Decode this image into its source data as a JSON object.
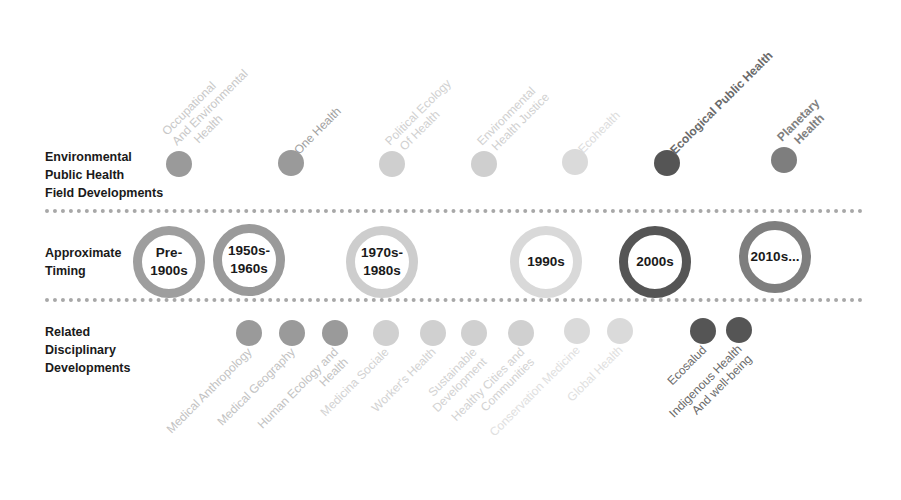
{
  "rows": {
    "field": "Environmental\nPublic Health\nField Developments",
    "timing": "Approximate\nTiming",
    "related": "Related\nDisciplinary\nDevelopments"
  },
  "field_developments": [
    {
      "label": "Occupational\nAnd Environmental\n     Health",
      "x": 179,
      "y": 164,
      "color": "#9a9a9a",
      "text_color": "#c8c8c8",
      "bold": false
    },
    {
      "label": "One Health",
      "x": 291,
      "y": 163,
      "color": "#9a9a9a",
      "text_color": "#a0a0a0",
      "bold": false
    },
    {
      "label": "Political Ecology\n  Of Health",
      "x": 392,
      "y": 164,
      "color": "#cfcfcf",
      "text_color": "#d0d0d0",
      "bold": false
    },
    {
      "label": "Environmental\n  Health Justice",
      "x": 484,
      "y": 164,
      "color": "#cfcfcf",
      "text_color": "#d0d0d0",
      "bold": false
    },
    {
      "label": "Ecohealth",
      "x": 575,
      "y": 162,
      "color": "#dadada",
      "text_color": "#dcdcdc",
      "bold": false
    },
    {
      "label": "Ecological Public Health",
      "x": 667,
      "y": 163,
      "color": "#555555",
      "text_color": "#6a6a6a",
      "bold": true
    },
    {
      "label": "Planetary\n   Health",
      "x": 784,
      "y": 160,
      "color": "#7e7e7e",
      "text_color": "#808080",
      "bold": true
    }
  ],
  "timing": [
    {
      "label": "Pre-\n1900s",
      "x": 169,
      "y": 262,
      "color": "#9e9e9e"
    },
    {
      "label": "1950s-\n1960s",
      "x": 249,
      "y": 260,
      "color": "#9a9a9a"
    },
    {
      "label": "1970s-\n1980s",
      "x": 382,
      "y": 262,
      "color": "#cdcdcd"
    },
    {
      "label": "1990s",
      "x": 546,
      "y": 262,
      "color": "#d9d9d9"
    },
    {
      "label": "2000s",
      "x": 655,
      "y": 262,
      "color": "#555555"
    },
    {
      "label": "2010s...",
      "x": 775,
      "y": 257,
      "color": "#7e7e7e"
    }
  ],
  "related_developments": [
    {
      "label": "Medical Anthropology",
      "x": 249,
      "y": 333,
      "color": "#9a9a9a",
      "text_color": "#c2c2c2"
    },
    {
      "label": "Medical Geography",
      "x": 292,
      "y": 333,
      "color": "#9a9a9a",
      "text_color": "#c2c2c2"
    },
    {
      "label": "Human Ecology and\nHealth",
      "x": 335,
      "y": 333,
      "color": "#9a9a9a",
      "text_color": "#c2c2c2"
    },
    {
      "label": "Medicina Sociale",
      "x": 386,
      "y": 333,
      "color": "#d0d0d0",
      "text_color": "#d2d2d2"
    },
    {
      "label": "Worker's Health",
      "x": 433,
      "y": 333,
      "color": "#d0d0d0",
      "text_color": "#d2d2d2"
    },
    {
      "label": "Sustainable\nDevelopment",
      "x": 474,
      "y": 333,
      "color": "#d0d0d0",
      "text_color": "#d2d2d2"
    },
    {
      "label": "Healthy Cities and\nCommunities",
      "x": 521,
      "y": 333,
      "color": "#d0d0d0",
      "text_color": "#d2d2d2"
    },
    {
      "label": "Conservation Medicine",
      "x": 577,
      "y": 331,
      "color": "#dadada",
      "text_color": "#e0e0e0"
    },
    {
      "label": "Global Health",
      "x": 620,
      "y": 331,
      "color": "#dadada",
      "text_color": "#e0e0e0"
    },
    {
      "label": "Ecosalud",
      "x": 703,
      "y": 331,
      "color": "#555555",
      "text_color": "#6a6a6a"
    },
    {
      "label": "Indigenous Health\nAnd well-being",
      "x": 739,
      "y": 330,
      "color": "#555555",
      "text_color": "#6a6a6a"
    }
  ]
}
